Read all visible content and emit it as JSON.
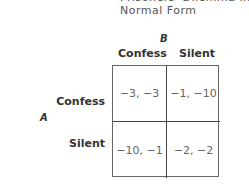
{
  "title": {
    "line1": "Prisoners' Dilemma in",
    "line2": "Normal Form"
  },
  "players": {
    "column": "B",
    "row": "A"
  },
  "columns": [
    "Confess",
    "Silent"
  ],
  "rows": [
    "Confess",
    "Silent"
  ],
  "payoffs": [
    [
      "−3, −3",
      "−1, −10"
    ],
    [
      "−10, −1",
      "−2, −2"
    ]
  ]
}
